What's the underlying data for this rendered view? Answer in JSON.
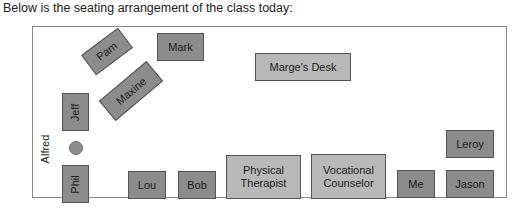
{
  "caption": "Below is the seating arrangement of the class today:",
  "room": {
    "label": "Classroom seating diagram",
    "seats": {
      "mark": "Mark",
      "pam": "Pam",
      "maxine": "Maxine",
      "marges_desk": "Marge's Desk",
      "jeff": "Jeff",
      "alfred": "Alfred",
      "phil": "Phil",
      "lou": "Lou",
      "bob": "Bob",
      "physical_therapist": "Physical Therapist",
      "vocational_counselor": "Vocational Counselor",
      "me": "Me",
      "leroy": "Leroy",
      "jason": "Jason"
    }
  },
  "colors": {
    "student_seat": "#8c8c8c",
    "staff_seat": "#b8b8b8",
    "border": "#8a8a8a"
  }
}
